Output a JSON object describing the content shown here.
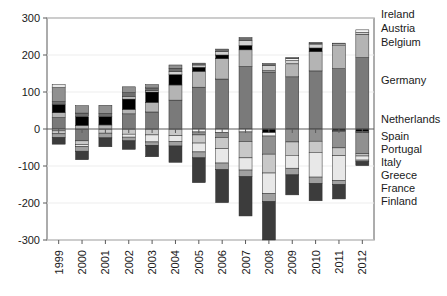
{
  "chart_data": {
    "type": "bar",
    "title": "",
    "subtitle": "",
    "xlabel": "",
    "ylabel": "",
    "stacked": true,
    "grid": true,
    "legend_position": "right",
    "ylim": [
      -300,
      300
    ],
    "yticks": [
      300,
      200,
      100,
      0,
      -100,
      -200,
      -300
    ],
    "ytick_labels": [
      "300",
      "200",
      "100",
      "0",
      "-100",
      "-200",
      "-300"
    ],
    "categories": [
      "1999",
      "2000",
      "2001",
      "2002",
      "2003",
      "2004",
      "2005",
      "2006",
      "2007",
      "2008",
      "2009",
      "2010",
      "2011",
      "2012"
    ],
    "legend_entries": [
      "Ireland",
      "Austria",
      "Belgium",
      "Germany",
      "Netherlands",
      "Spain",
      "Portugal",
      "Italy",
      "Greece",
      "France",
      "Finland"
    ],
    "series": [
      {
        "name": "Germany",
        "color": "#7a7a7a",
        "values": [
          31,
          -32,
          0,
          41,
          46,
          78,
          113,
          135,
          169,
          154,
          141,
          157,
          163,
          193
        ]
      },
      {
        "name": "Netherlands",
        "color": "#b4b4b4",
        "values": [
          13,
          10,
          11,
          12,
          26,
          41,
          43,
          55,
          45,
          4,
          35,
          52,
          62,
          63
        ]
      },
      {
        "name": "Belgium",
        "color": "#000000",
        "values": [
          22,
          23,
          22,
          28,
          28,
          28,
          11,
          10,
          12,
          -10,
          1,
          10,
          -4,
          -6
        ]
      },
      {
        "name": "Austria",
        "color": "#d2d2d2",
        "values": [
          -5,
          1,
          0,
          6,
          4,
          8,
          6,
          9,
          13,
          14,
          8,
          9,
          5,
          5
        ]
      },
      {
        "name": "Ireland",
        "color": "#f4f4f4",
        "values": [
          1,
          0,
          -1,
          -1,
          -1,
          -1,
          -8,
          -10,
          -8,
          -9,
          5,
          3,
          2,
          7
        ]
      },
      {
        "name": "Finland",
        "color": "#6e6e6e",
        "values": [
          7,
          9,
          9,
          11,
          7,
          9,
          5,
          7,
          8,
          5,
          3,
          3,
          -2,
          -4
        ]
      },
      {
        "name": "France",
        "color": "#909090",
        "values": [
          38,
          20,
          22,
          16,
          9,
          9,
          -8,
          -13,
          -26,
          -49,
          -35,
          -33,
          -45,
          -57
        ]
      },
      {
        "name": "Greece",
        "color": "#c8c8c8",
        "values": [
          -8,
          -10,
          -10,
          -13,
          -15,
          -17,
          -22,
          -30,
          -44,
          -51,
          -36,
          -30,
          -21,
          -6
        ]
      },
      {
        "name": "Italy",
        "color": "#e8e8e8",
        "values": [
          8,
          -6,
          -1,
          -8,
          -19,
          -16,
          -24,
          -39,
          -33,
          -55,
          -35,
          -67,
          -67,
          -11
        ]
      },
      {
        "name": "Portugal",
        "color": "#a0a0a0",
        "values": [
          -10,
          -12,
          -12,
          -10,
          -9,
          -12,
          -16,
          -18,
          -18,
          -22,
          -18,
          -17,
          -11,
          -4
        ]
      },
      {
        "name": "Spain",
        "color": "#3c3c3c",
        "values": [
          -18,
          -23,
          -24,
          -23,
          -31,
          -44,
          -67,
          -89,
          -106,
          -104,
          -54,
          -47,
          -39,
          -11
        ]
      }
    ],
    "annotations": []
  },
  "legend": {
    "items": [
      {
        "label": "Ireland",
        "y": 18
      },
      {
        "label": "Austria",
        "y": 32
      },
      {
        "label": "Belgium",
        "y": 46
      },
      {
        "label": "Germany",
        "y": 84
      },
      {
        "label": "Netherlands",
        "y": 123
      },
      {
        "label": "Spain",
        "y": 140
      },
      {
        "label": "Portugal",
        "y": 153
      },
      {
        "label": "Italy",
        "y": 166
      },
      {
        "label": "Greece",
        "y": 179
      },
      {
        "label": "France",
        "y": 192
      },
      {
        "label": "Finland",
        "y": 205
      }
    ]
  }
}
